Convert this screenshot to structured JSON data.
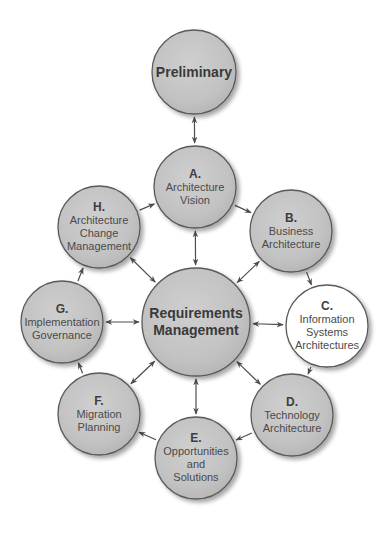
{
  "diagram": {
    "colors": {
      "node_fill": "#c4c4c4",
      "node_fill_light": "#d2d2d2",
      "node_stroke": "#5a5a5a",
      "highlight_fill": "#ffffff",
      "arrow": "#4d4d4d",
      "text": "#4a4a4a"
    },
    "nodes": [
      {
        "id": "preliminary",
        "letter": "",
        "lines": [
          "Preliminary"
        ],
        "cx": 194,
        "cy": 72,
        "r": 42,
        "highlight": false,
        "big": true
      },
      {
        "id": "a",
        "letter": "A.",
        "lines": [
          "Architecture",
          "Vision"
        ],
        "cx": 195,
        "cy": 187,
        "r": 41,
        "highlight": false,
        "big": false
      },
      {
        "id": "b",
        "letter": "B.",
        "lines": [
          "Business",
          "Architecture"
        ],
        "cx": 291,
        "cy": 231,
        "r": 41,
        "highlight": false,
        "big": false
      },
      {
        "id": "c",
        "letter": "C.",
        "lines": [
          "Information",
          "Systems",
          "Architectures"
        ],
        "cx": 327,
        "cy": 326,
        "r": 41,
        "highlight": true,
        "big": false
      },
      {
        "id": "d",
        "letter": "D.",
        "lines": [
          "Technology",
          "Architecture"
        ],
        "cx": 292,
        "cy": 415,
        "r": 41,
        "highlight": false,
        "big": false
      },
      {
        "id": "e",
        "letter": "E.",
        "lines": [
          "Opportunities",
          "and",
          "Solutions"
        ],
        "cx": 196,
        "cy": 458,
        "r": 41,
        "highlight": false,
        "big": false
      },
      {
        "id": "f",
        "letter": "F.",
        "lines": [
          "Migration",
          "Planning"
        ],
        "cx": 99,
        "cy": 414,
        "r": 41,
        "highlight": false,
        "big": false
      },
      {
        "id": "g",
        "letter": "G.",
        "lines": [
          "Implementation",
          "Governance"
        ],
        "cx": 62,
        "cy": 322,
        "r": 41,
        "highlight": false,
        "big": false
      },
      {
        "id": "h",
        "letter": "H.",
        "lines": [
          "Architecture",
          "Change",
          "Management"
        ],
        "cx": 99,
        "cy": 227,
        "r": 41,
        "highlight": false,
        "big": false
      },
      {
        "id": "rm",
        "letter": "",
        "lines": [
          "Requirements",
          "Management"
        ],
        "cx": 196,
        "cy": 322,
        "r": 54,
        "highlight": false,
        "big": true
      }
    ],
    "edges": [
      {
        "from": "preliminary",
        "to": "a",
        "bidirectional": true
      },
      {
        "from": "a",
        "to": "b",
        "bidirectional": false
      },
      {
        "from": "b",
        "to": "c",
        "bidirectional": false
      },
      {
        "from": "c",
        "to": "d",
        "bidirectional": false
      },
      {
        "from": "d",
        "to": "e",
        "bidirectional": false
      },
      {
        "from": "e",
        "to": "f",
        "bidirectional": false
      },
      {
        "from": "f",
        "to": "g",
        "bidirectional": false
      },
      {
        "from": "g",
        "to": "h",
        "bidirectional": false
      },
      {
        "from": "h",
        "to": "a",
        "bidirectional": false
      },
      {
        "from": "rm",
        "to": "a",
        "bidirectional": true
      },
      {
        "from": "rm",
        "to": "b",
        "bidirectional": true
      },
      {
        "from": "rm",
        "to": "c",
        "bidirectional": true
      },
      {
        "from": "rm",
        "to": "d",
        "bidirectional": true
      },
      {
        "from": "rm",
        "to": "e",
        "bidirectional": true
      },
      {
        "from": "rm",
        "to": "f",
        "bidirectional": true
      },
      {
        "from": "rm",
        "to": "g",
        "bidirectional": true
      },
      {
        "from": "rm",
        "to": "h",
        "bidirectional": true
      }
    ]
  }
}
